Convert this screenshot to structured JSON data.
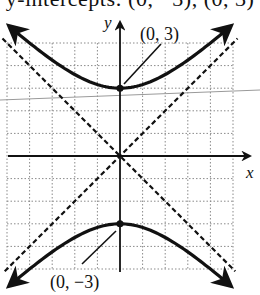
{
  "caption_cropped": "y-intercepts: (0, −3), (0, 3)",
  "axes": {
    "x_label": "x",
    "y_label": "y",
    "origin_px": [
      120,
      156
    ],
    "unit_px": 22.6,
    "grid_range": {
      "x": [
        -5,
        5
      ],
      "y": [
        -5,
        5
      ]
    }
  },
  "curve": {
    "type": "hyperbola",
    "equation": "y^2/9 - x^2/9 = 1",
    "vertices": [
      {
        "label": "(0, 3)",
        "x": 0,
        "y": 3
      },
      {
        "label": "(0, −3)",
        "x": 0,
        "y": -3
      }
    ],
    "asymptotes": [
      "y = x",
      "y = -x"
    ]
  },
  "colors": {
    "ink": "#111111",
    "grid": "#8a8a8a",
    "artifact_line": "#9a9a9a",
    "background": "#ffffff"
  },
  "labels": {
    "top_vertex": "(0, 3)",
    "bottom_vertex": "(0, −3)"
  }
}
